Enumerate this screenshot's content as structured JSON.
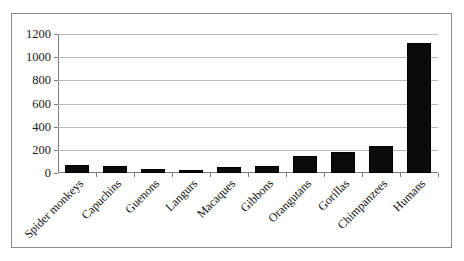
{
  "chart_data": {
    "type": "bar",
    "title": "",
    "subtitle": "",
    "xlabel": "",
    "ylabel": "",
    "ylim": [
      0,
      1200
    ],
    "ytick_values": [
      0,
      200,
      400,
      600,
      800,
      1000,
      1200
    ],
    "ytick_labels": [
      "0",
      "200",
      "400",
      "600",
      "800",
      "1000",
      "1200"
    ],
    "grid": true,
    "legend": false,
    "legend_position": "none",
    "categories": [
      "Spider monkeys",
      "Capuchins",
      "Guenons",
      "Langurs",
      "Macaques",
      "Gibbons",
      "Orangutans",
      "Gorillas",
      "Chimpanzees",
      "Humans"
    ],
    "values": [
      65,
      60,
      35,
      25,
      55,
      58,
      145,
      180,
      230,
      1120
    ],
    "bar_color": "#0b0b0b",
    "grid_color": "#b9b9b9",
    "axis_color": "#7d7d7d",
    "border_color": "#8a8a8a",
    "background_color": "#ffffff"
  }
}
